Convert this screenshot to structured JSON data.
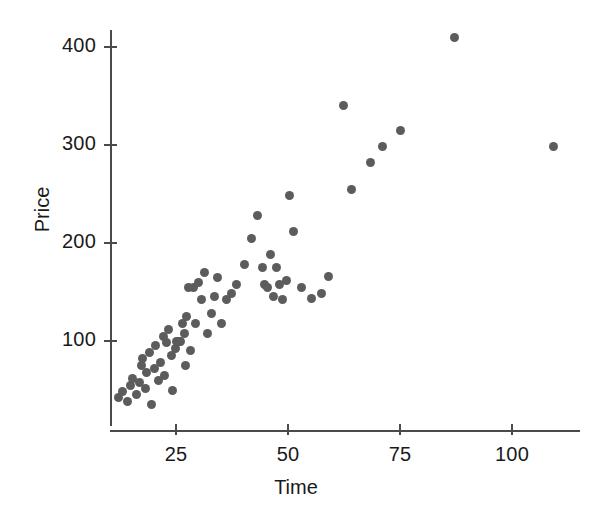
{
  "chart_data": {
    "type": "scatter",
    "title": "",
    "xlabel": "Time",
    "ylabel": "Price",
    "xlim": [
      9,
      118
    ],
    "ylim": [
      20,
      425
    ],
    "grid": false,
    "legend": null,
    "marker": {
      "shape": "circle",
      "color": "#5c5c5c",
      "size_px": 9
    },
    "xticks": [
      25,
      50,
      75,
      100
    ],
    "xtick_labels": [
      "25",
      "50",
      "75",
      "100"
    ],
    "yticks": [
      100,
      200,
      300,
      400
    ],
    "ytick_labels": [
      "100",
      "200",
      "300",
      "400"
    ],
    "x": [
      12.2,
      13.1,
      14.1,
      14.8,
      15.4,
      16.1,
      16.9,
      17.2,
      17.6,
      18.1,
      18.4,
      19.1,
      19.6,
      20.1,
      20.4,
      21.1,
      21.6,
      22.1,
      22.4,
      22.9,
      23.4,
      23.9,
      24.3,
      24.8,
      25.2,
      25.4,
      25.8,
      26.1,
      26.4,
      26.8,
      27.1,
      27.4,
      27.8,
      28.3,
      28.8,
      29.4,
      30.1,
      30.8,
      31.4,
      32.1,
      32.9,
      33.6,
      34.3,
      35.1,
      36.2,
      37.4,
      38.6,
      40.2,
      41.8,
      43.1,
      44.2,
      44.8,
      45.4,
      46.1,
      46.8,
      47.4,
      48.1,
      48.8,
      49.6,
      50.4,
      51.2,
      53.1,
      55.2,
      57.4,
      59.1,
      62.4,
      64.1,
      68.4,
      71.2,
      75.2,
      87.1,
      109.2
    ],
    "y": [
      42,
      48,
      38,
      55,
      62,
      45,
      58,
      75,
      82,
      52,
      68,
      88,
      35,
      72,
      95,
      60,
      78,
      105,
      65,
      98,
      112,
      85,
      50,
      92,
      100,
      100,
      100,
      100,
      118,
      108,
      75,
      125,
      155,
      90,
      155,
      118,
      160,
      142,
      170,
      108,
      128,
      145,
      165,
      118,
      142,
      148,
      158,
      178,
      205,
      228,
      175,
      158,
      155,
      188,
      145,
      175,
      158,
      142,
      162,
      248,
      212,
      155,
      143,
      148,
      166,
      340,
      255,
      282,
      298,
      315,
      410,
      298
    ],
    "n_points": 72
  },
  "axis": {
    "y_title": "Price",
    "x_title": "Time"
  }
}
